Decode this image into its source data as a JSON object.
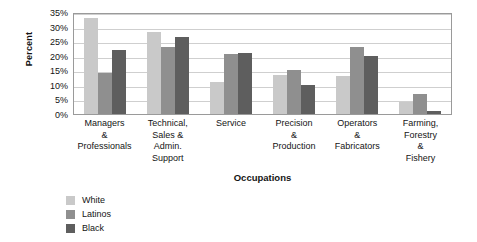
{
  "chart_data": {
    "type": "bar",
    "title": "",
    "xlabel": "Occupations",
    "ylabel": "Percent",
    "categories": [
      "Managers\n&\nProfessionals",
      "Technical,\nSales &\nAdmin.\nSupport",
      "Service",
      "Precision\n&\nProduction",
      "Operators\n&\nFabricators",
      "Farming,\nForestry\n&\nFishery"
    ],
    "category_lines": [
      [
        "Managers",
        "&",
        "Professionals"
      ],
      [
        "Technical,",
        "Sales &",
        "Admin.",
        "Support"
      ],
      [
        "Service"
      ],
      [
        "Precision",
        "&",
        "Production"
      ],
      [
        "Operators",
        "&",
        "Fabricators"
      ],
      [
        "Farming,",
        "Forestry",
        "&",
        "Fishery"
      ]
    ],
    "series": [
      {
        "name": "White",
        "color": "#c9c9c9",
        "values": [
          33.0,
          28.0,
          11.0,
          13.5,
          13.0,
          4.0
        ]
      },
      {
        "name": "Latinos",
        "color": "#8f8f8f",
        "values": [
          14.0,
          23.0,
          20.5,
          15.0,
          23.0,
          7.0
        ]
      },
      {
        "name": "Black",
        "color": "#5e5e5e",
        "values": [
          22.0,
          26.5,
          21.0,
          10.0,
          20.0,
          1.0
        ]
      }
    ],
    "ylim": [
      0,
      35
    ],
    "yticks": [
      0,
      5,
      10,
      15,
      20,
      25,
      30,
      35
    ],
    "ytick_labels": [
      "0%",
      "5%",
      "10%",
      "15%",
      "20%",
      "25%",
      "30%",
      "35%"
    ],
    "grid": true,
    "grid_axis": "y",
    "legend_position": "bottom-left",
    "legend_entries": [
      "White",
      "Latinos",
      "Black"
    ]
  }
}
